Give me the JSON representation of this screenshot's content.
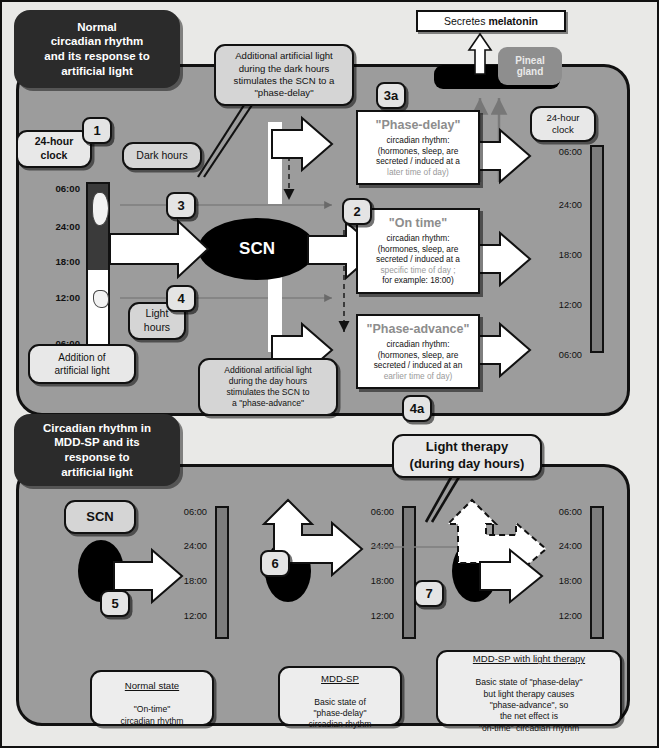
{
  "panels": {
    "top_title": "Normal\ncircadian rhythm\nand its response to\nartificial light",
    "bottom_title": "Circadian rhythm in\nMDD-SP and its\nresponse to\nartificial light"
  },
  "melatonin": {
    "prefix": "Secretes",
    "bold": "melatonin"
  },
  "pineal": {
    "label": "Pineal\ngland"
  },
  "top_panel": {
    "clock_label_left": "24-hour\nclock",
    "clock_label_right": "24-hour\nclock",
    "dark_hours": "Dark hours",
    "light_hours": "Light\nhours",
    "addition_light": "Addition of\nartificial light",
    "scn": "SCN",
    "callout_dark": "Additional artificial light\nduring the dark hours\nstimulates the SCN to a\n\"phase-delay\"",
    "callout_day": "Additional artificial light\nduring the day hours\nstimulates the SCN to\na \"phase-advance\"",
    "left_ticks": [
      "06:00",
      "24:00",
      "18:00",
      "12:00",
      "06:00"
    ],
    "right_ticks": [
      "06:00",
      "24:00",
      "18:00",
      "12:00",
      "06:00"
    ],
    "badges": [
      "1",
      "3",
      "4",
      "3a",
      "2",
      "4a"
    ],
    "boxes": [
      {
        "id": "phase-delay",
        "head": "\"Phase-delay\"",
        "line1": "circadian rhythm:",
        "line2": "(hormones, sleep, are",
        "line3": "secreted / induced at a",
        "line4": "later time of day)"
      },
      {
        "id": "on-time",
        "head": "\"On time\"",
        "line1": "circadian rhythm:",
        "line2": "(hormones, sleep, are",
        "line3": "secreted / induced at a",
        "line4": "specific time of day ;",
        "line5": "for example: 18:00)"
      },
      {
        "id": "phase-advance",
        "head": "\"Phase-advance\"",
        "line1": "circadian rhythm:",
        "line2": "(hormones, sleep, are",
        "line3": "secreted / induced at an",
        "line4": "earlier time of day)"
      }
    ]
  },
  "bottom_panel": {
    "scn": "SCN",
    "light_therapy": "Light therapy\n(during day hours)",
    "badges": [
      "5",
      "6",
      "7"
    ],
    "ticks": [
      "06:00",
      "24:00",
      "18:00",
      "12:00"
    ],
    "foot": [
      {
        "title": "Normal state",
        "body": "\"On-time\"\ncircadian rhythm"
      },
      {
        "title": "MDD-SP",
        "body": "Basic state of\n\"phase-delay\"\ncircadian rhythm"
      },
      {
        "title": "MDD-SP with light therapy",
        "body": "Basic state of \"phase-delay\"\nbut light therapy causes\n\"phase-advance\", so\nthe net effect is\n\"on-time\" circadian rhythm"
      }
    ]
  },
  "colors": {
    "panel_bg": "#9c9c9c",
    "outer_bg": "#e9e9e7",
    "title_bg": "#2b2b2b",
    "clock_bar": "#7c7c7c",
    "dark_hours": "#3a3a3a",
    "scn": "#000000"
  }
}
